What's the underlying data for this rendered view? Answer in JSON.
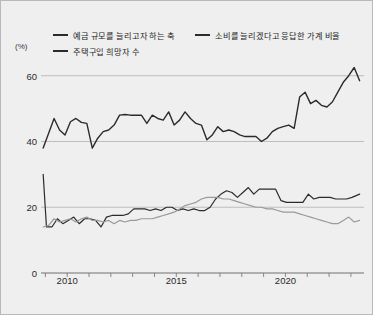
{
  "figure": {
    "background_color": "#efefef",
    "border_color": "#b9b9b9"
  },
  "axis": {
    "unit_label": "(%)",
    "y_ticks": [
      "60",
      "40",
      "20",
      "0"
    ],
    "x_ticks": [
      "2010",
      "2015",
      "2020"
    ]
  },
  "legend": {
    "rows": [
      [
        {
          "label": "예금 규모를 늘리고자 하는 축",
          "color": "#2b2b2b"
        },
        {
          "label": "소비를 늘리겠다고 응답한 가계 비율",
          "color": "#2b2b2b"
        }
      ],
      [
        {
          "label": "주택구입 희망자 수",
          "color": "#2b2b2b"
        }
      ]
    ]
  },
  "chart_data": {
    "type": "line",
    "title": "",
    "xlabel": "",
    "ylabel": "(%)",
    "xlim": [
      2008.8,
      2023.6
    ],
    "ylim": [
      0,
      66
    ],
    "y_ticks": [
      0,
      20,
      40,
      60
    ],
    "x_ticks": [
      2010,
      2015,
      2020
    ],
    "x_minor_tick_step": 1,
    "grid": "horizontal-at-20-40-60",
    "legend_position": "top-left",
    "series": [
      {
        "name": "예금 규모를 늘리고자 하는 축",
        "color": "#2b2b2b",
        "width": 1.4,
        "x": [
          2008.9,
          2009.15,
          2009.4,
          2009.65,
          2009.9,
          2010.15,
          2010.4,
          2010.65,
          2010.9,
          2011.15,
          2011.4,
          2011.65,
          2011.9,
          2012.15,
          2012.4,
          2012.65,
          2012.9,
          2013.15,
          2013.4,
          2013.65,
          2013.9,
          2014.15,
          2014.4,
          2014.65,
          2014.9,
          2015.15,
          2015.4,
          2015.65,
          2015.9,
          2016.15,
          2016.4,
          2016.65,
          2016.9,
          2017.15,
          2017.4,
          2017.65,
          2017.9,
          2018.15,
          2018.4,
          2018.65,
          2018.9,
          2019.15,
          2019.4,
          2019.65,
          2019.9,
          2020.15,
          2020.4,
          2020.65,
          2020.9,
          2021.15,
          2021.4,
          2021.65,
          2021.9,
          2022.15,
          2022.4,
          2022.65,
          2022.9,
          2023.15,
          2023.4
        ],
        "values": [
          38.0,
          42.5,
          47.0,
          43.5,
          42.0,
          46.0,
          47.0,
          45.8,
          45.5,
          38.0,
          41.0,
          43.0,
          43.5,
          45.0,
          48.0,
          48.2,
          48.0,
          48.0,
          48.0,
          45.5,
          48.0,
          47.0,
          46.5,
          49.0,
          45.0,
          46.5,
          49.0,
          47.0,
          45.5,
          45.0,
          40.5,
          42.0,
          44.5,
          43.0,
          43.5,
          43.0,
          42.0,
          41.5,
          41.5,
          41.5,
          40.0,
          41.0,
          43.0,
          44.0,
          44.5,
          45.0,
          44.0,
          53.5,
          55.0,
          51.5,
          52.5,
          51.0,
          50.5,
          52.0,
          55.0,
          58.0,
          60.0,
          62.5,
          58.5
        ]
      },
      {
        "name": "소비를 늘리겠다고 응답한 가계 비율",
        "color": "#2b2b2b",
        "width": 1.2,
        "x": [
          2008.9,
          2009.05,
          2009.3,
          2009.55,
          2009.8,
          2010.05,
          2010.3,
          2010.55,
          2010.8,
          2011.05,
          2011.3,
          2011.55,
          2011.8,
          2012.05,
          2012.3,
          2012.55,
          2012.8,
          2013.05,
          2013.3,
          2013.55,
          2013.8,
          2014.05,
          2014.3,
          2014.55,
          2014.8,
          2015.05,
          2015.3,
          2015.55,
          2015.8,
          2016.05,
          2016.3,
          2016.55,
          2016.8,
          2017.05,
          2017.3,
          2017.55,
          2017.8,
          2018.05,
          2018.3,
          2018.55,
          2018.8,
          2019.05,
          2019.3,
          2019.55,
          2019.8,
          2020.05,
          2020.3,
          2020.55,
          2020.8,
          2021.05,
          2021.3,
          2021.55,
          2021.8,
          2022.05,
          2022.3,
          2022.55,
          2022.8,
          2023.05,
          2023.4
        ],
        "values": [
          30.0,
          14.0,
          14.0,
          16.5,
          15.0,
          16.0,
          17.0,
          15.0,
          16.5,
          16.5,
          16.0,
          14.0,
          17.0,
          17.5,
          17.5,
          17.5,
          18.0,
          19.5,
          19.5,
          19.5,
          19.0,
          19.5,
          19.0,
          20.0,
          20.0,
          19.0,
          19.5,
          19.0,
          19.5,
          19.0,
          19.0,
          20.0,
          22.5,
          24.0,
          25.0,
          24.5,
          23.0,
          24.5,
          26.0,
          24.0,
          25.5,
          25.5,
          25.5,
          25.5,
          22.0,
          21.5,
          21.5,
          21.5,
          21.5,
          24.0,
          22.5,
          23.0,
          23.0,
          23.0,
          22.5,
          22.5,
          22.5,
          23.0,
          24.0
        ]
      },
      {
        "name": "주택구입 희망자 수",
        "color": "#9a9a9a",
        "width": 1.2,
        "x": [
          2008.9,
          2009.15,
          2009.4,
          2009.65,
          2009.9,
          2010.15,
          2010.4,
          2010.65,
          2010.9,
          2011.15,
          2011.4,
          2011.65,
          2011.9,
          2012.15,
          2012.4,
          2012.65,
          2012.9,
          2013.15,
          2013.4,
          2013.65,
          2013.9,
          2014.15,
          2014.4,
          2014.65,
          2014.9,
          2015.15,
          2015.4,
          2015.65,
          2015.9,
          2016.15,
          2016.4,
          2016.65,
          2016.9,
          2017.15,
          2017.4,
          2017.65,
          2017.9,
          2018.15,
          2018.4,
          2018.65,
          2018.9,
          2019.15,
          2019.4,
          2019.65,
          2019.9,
          2020.15,
          2020.4,
          2020.65,
          2020.9,
          2021.15,
          2021.4,
          2021.65,
          2021.9,
          2022.15,
          2022.4,
          2022.65,
          2022.9,
          2023.15,
          2023.4
        ],
        "values": [
          14.0,
          14.5,
          16.5,
          15.5,
          16.0,
          16.5,
          15.5,
          16.5,
          17.0,
          16.0,
          16.0,
          15.5,
          16.0,
          15.0,
          16.0,
          15.5,
          16.0,
          16.0,
          16.5,
          16.5,
          16.5,
          17.0,
          17.5,
          18.0,
          18.5,
          19.5,
          20.5,
          21.0,
          21.5,
          22.5,
          23.0,
          23.0,
          23.0,
          22.5,
          22.5,
          22.0,
          21.5,
          21.0,
          20.5,
          20.0,
          20.0,
          19.5,
          19.5,
          19.0,
          18.5,
          18.5,
          18.5,
          18.0,
          17.5,
          17.0,
          16.5,
          16.0,
          15.5,
          15.0,
          15.0,
          16.0,
          17.0,
          15.5,
          16.0
        ]
      }
    ]
  }
}
